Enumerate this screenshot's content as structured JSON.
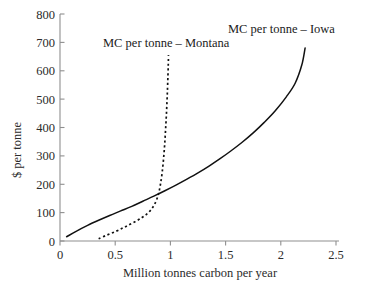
{
  "chart_data": {
    "type": "line",
    "title": "",
    "xlabel": "Million tonnes carbon per year",
    "ylabel": "$ per tonne",
    "xlim": [
      0,
      2.5
    ],
    "ylim": [
      0,
      800
    ],
    "grid": false,
    "legend_position": "inline-annotations",
    "xticks": [
      "0",
      "0.5",
      "1",
      "1.5",
      "2",
      "2.5"
    ],
    "xtick_values": [
      0,
      0.5,
      1,
      1.5,
      2,
      2.5
    ],
    "yticks": [
      "0",
      "100",
      "200",
      "300",
      "400",
      "500",
      "600",
      "700",
      "800"
    ],
    "ytick_values": [
      0,
      100,
      200,
      300,
      400,
      500,
      600,
      700,
      800
    ],
    "series": [
      {
        "name": "MC per tonne – Iowa",
        "style": "solid",
        "color": "#111111",
        "x": [
          0.06,
          0.15,
          0.25,
          0.35,
          0.45,
          0.55,
          0.65,
          0.75,
          0.85,
          0.95,
          1.05,
          1.15,
          1.25,
          1.35,
          1.45,
          1.55,
          1.65,
          1.75,
          1.85,
          1.95,
          2.05,
          2.13,
          2.19,
          2.22
        ],
        "y": [
          15,
          35,
          55,
          73,
          90,
          106,
          122,
          140,
          158,
          177,
          197,
          218,
          240,
          264,
          290,
          318,
          348,
          381,
          418,
          459,
          508,
          556,
          620,
          680
        ]
      },
      {
        "name": "MC per tonne – Montana",
        "style": "dotted",
        "color": "#111111",
        "x": [
          0.35,
          0.42,
          0.5,
          0.57,
          0.63,
          0.69,
          0.74,
          0.78,
          0.82,
          0.85,
          0.875,
          0.895,
          0.91,
          0.925,
          0.938,
          0.948,
          0.956,
          0.963,
          0.969,
          0.974,
          0.978,
          0.981,
          0.983
        ],
        "y": [
          8,
          20,
          33,
          46,
          58,
          70,
          82,
          93,
          108,
          125,
          145,
          170,
          200,
          240,
          290,
          340,
          390,
          440,
          490,
          540,
          585,
          625,
          655
        ]
      }
    ],
    "annotations": [
      {
        "text": "MC per tonne – Montana",
        "x": 0.39,
        "y": 690
      },
      {
        "text": "MC per tonne – Iowa",
        "x": 1.48,
        "y": 740
      }
    ]
  }
}
